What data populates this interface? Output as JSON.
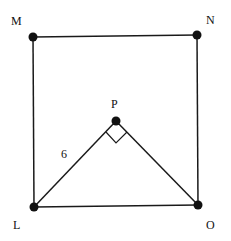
{
  "diagram": {
    "points": {
      "M": {
        "label": "M",
        "x": 33,
        "y": 37
      },
      "N": {
        "label": "N",
        "x": 197,
        "y": 35
      },
      "L": {
        "label": "L",
        "x": 34,
        "y": 207
      },
      "O": {
        "label": "O",
        "x": 198,
        "y": 205
      },
      "P": {
        "label": "P",
        "x": 116,
        "y": 121
      }
    },
    "segments": [
      "MN",
      "NO",
      "OL",
      "LM",
      "LP",
      "PO"
    ],
    "edge_label_LP": "6",
    "right_angle_at": "P"
  }
}
